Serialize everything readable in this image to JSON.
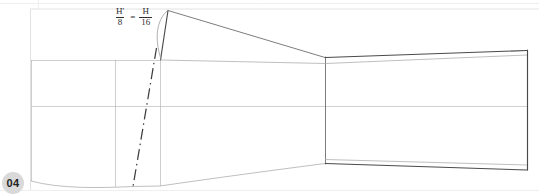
{
  "sheet": {
    "width": 539,
    "height": 195,
    "background": "#ffffff",
    "page_badge": {
      "label": "04",
      "fill": "#d9d9d9",
      "text_color": "#222222"
    }
  },
  "annotation": {
    "formula": {
      "text": "H'/8 = H/16",
      "left": {
        "numerator": "H'",
        "denominator": "8"
      },
      "operator": "=",
      "right": {
        "numerator": "H",
        "denominator": "16"
      }
    }
  },
  "drawing": {
    "title": "tapered-profile-construction-drawing",
    "colors": {
      "outline_heavy": "#4a4a4a",
      "outline_mid": "#6e6e6e",
      "outline_light": "#a9a9a9",
      "construction": "#b9b9b9",
      "centerline": "#bdbdbd",
      "dashdot": "#3d3d3d",
      "sheet_rule": "#e2e2e2"
    },
    "features": [
      {
        "name": "left-block",
        "type": "rectangle",
        "note": "left rectangular station block"
      },
      {
        "name": "left-block-divider",
        "type": "vertical-line",
        "note": "interior vertical station line"
      },
      {
        "name": "horizontal-centerline",
        "type": "centerline",
        "note": "full-width horizontal centerline"
      },
      {
        "name": "dash-dot-construction-line",
        "type": "dash-dot",
        "note": "inclined construction line"
      },
      {
        "name": "apex-peak",
        "type": "vertex",
        "note": "upper peak of profile"
      },
      {
        "name": "upper-taper-lines",
        "type": "polyline",
        "note": "two lines descending from apex to waist"
      },
      {
        "name": "waist-vertical",
        "type": "vertical-line",
        "note": "narrow-section vertical boundary"
      },
      {
        "name": "lower-contour",
        "type": "curve",
        "note": "lower sweeping contour rising to waist"
      },
      {
        "name": "right-flare-top",
        "type": "line",
        "note": "upper edge of right flared section"
      },
      {
        "name": "right-flare-bottom",
        "type": "line",
        "note": "lower edge of right flared section"
      },
      {
        "name": "right-end-vertical",
        "type": "vertical-line",
        "note": "right terminating edge"
      },
      {
        "name": "radius-arc",
        "type": "arc",
        "note": "small arc near apex"
      }
    ]
  }
}
